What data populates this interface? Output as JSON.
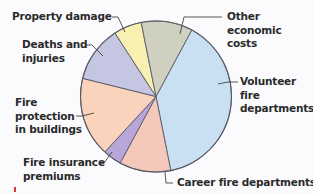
{
  "chart_data": {
    "type": "pie",
    "title": "",
    "start_angle_deg": 28.3,
    "direction": "clockwise",
    "slices": [
      {
        "label": "Volunteer fire departments",
        "value": 39,
        "color": "#c9e0f2"
      },
      {
        "label": "Career fire departments",
        "value": 11,
        "color": "#f5c8bc"
      },
      {
        "label": "Fire insurance premiums",
        "value": 4,
        "color": "#b9a6d8"
      },
      {
        "label": "Fire protection in buildings",
        "value": 17,
        "color": "#f9d3bc"
      },
      {
        "label": "Deaths and injuries",
        "value": 12,
        "color": "#c5c6e2"
      },
      {
        "label": "Property damage",
        "value": 6,
        "color": "#f7f0b0"
      },
      {
        "label": "Other economic costs",
        "value": 11,
        "color": "#cfd0bf"
      }
    ],
    "units": "approximate percent of total (estimated from slice angles)",
    "legend": "none (direct labels with leader lines)"
  },
  "labels": {
    "property_damage": [
      "Property damage"
    ],
    "deaths": [
      "Deaths and",
      "injuries"
    ],
    "fire_protection": [
      "Fire",
      "protection",
      "in buildings"
    ],
    "fire_insurance": [
      "Fire insurance",
      "premiums"
    ],
    "career": [
      "Career fire departments"
    ],
    "volunteer": [
      "Volunteer",
      "fire",
      "departments"
    ],
    "other": [
      "Other",
      "economic",
      "costs"
    ]
  },
  "style": {
    "outline_color": "#5a5a66",
    "leader_color": "#444444"
  }
}
